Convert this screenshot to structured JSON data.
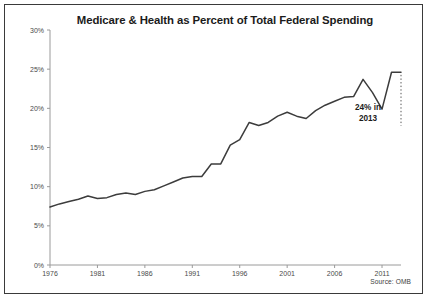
{
  "figure": {
    "title": "Medicare & Health as Percent of Total Federal Spending",
    "source_note": "Source: OMB",
    "annotation_line1": "24% in",
    "annotation_line2": "2013",
    "frame_color": "#3a3a3a",
    "line_color": "#3c3c3c",
    "axis_color": "#9a9a9a",
    "text_color": "#4a4a4a",
    "background": "#ffffff"
  },
  "chart_data": {
    "type": "line",
    "title": "Medicare & Health as Percent of Total Federal Spending",
    "subtitle": "",
    "xlabel": "",
    "ylabel": "",
    "xlim": [
      1976,
      2013
    ],
    "ylim": [
      0,
      30
    ],
    "grid": false,
    "legend": false,
    "legend_position": "none",
    "y_tick_labels": [
      "0%",
      "5%",
      "10%",
      "15%",
      "20%",
      "25%",
      "30%"
    ],
    "y_tick_values": [
      0,
      5,
      10,
      15,
      20,
      25,
      30
    ],
    "x_tick_labels": [
      "1976",
      "1981",
      "1986",
      "1991",
      "1996",
      "2001",
      "2006",
      "2011"
    ],
    "x_tick_values": [
      1976,
      1981,
      1986,
      1991,
      1996,
      2001,
      2006,
      2011
    ],
    "units": "percent",
    "annotations": [
      {
        "text": "24% in 2013",
        "x": 2013,
        "y": 24.4,
        "marker": "dotted-vertical-line"
      }
    ],
    "series": [
      {
        "name": "Medicare & Health as Percent of Total Federal Spending",
        "color": "#3c3c3c",
        "x": [
          1976,
          1977,
          1978,
          1979,
          1980,
          1981,
          1982,
          1983,
          1984,
          1985,
          1986,
          1987,
          1988,
          1989,
          1990,
          1991,
          1992,
          1993,
          1994,
          1995,
          1996,
          1997,
          1998,
          1999,
          2000,
          2001,
          2002,
          2003,
          2004,
          2005,
          2006,
          2007,
          2008,
          2009,
          2010,
          2011,
          2012,
          2013
        ],
        "values": [
          7.4,
          7.8,
          8.1,
          8.4,
          8.8,
          8.5,
          8.6,
          9.0,
          9.2,
          9.0,
          9.4,
          9.6,
          10.1,
          10.6,
          11.1,
          11.3,
          11.3,
          12.9,
          12.9,
          15.3,
          16.0,
          18.2,
          17.8,
          18.2,
          19.0,
          19.5,
          19.0,
          18.7,
          19.7,
          20.4,
          20.9,
          21.4,
          21.5,
          23.7,
          22.0,
          19.9,
          24.6,
          24.6
        ],
        "final_value": 24.4
      }
    ]
  }
}
